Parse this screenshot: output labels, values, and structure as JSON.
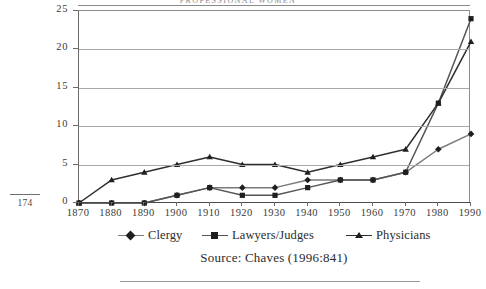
{
  "page": {
    "running_head": "PROFESSIONAL WOMEN",
    "folio": "174"
  },
  "source_caption": "Source: Chaves (1996:841)",
  "legend": {
    "entries": [
      {
        "label": "Clergy",
        "marker": "diamond-marker-icon",
        "color": "#7a7a7a"
      },
      {
        "label": "Lawyers/Judges",
        "marker": "square-marker-icon",
        "color": "#555555"
      },
      {
        "label": "Physicians",
        "marker": "triangle-marker-icon",
        "color": "#2f2f2f"
      }
    ]
  },
  "chart_data": {
    "type": "line",
    "title": "PROFESSIONAL WOMEN",
    "xlabel": "",
    "ylabel": "",
    "grid": true,
    "legend_position": "bottom",
    "xlim": [
      1870,
      1990
    ],
    "ylim": [
      0,
      25
    ],
    "ytick_labels": [
      "0",
      "5",
      "10",
      "15",
      "20",
      "25"
    ],
    "ytick_values": [
      0,
      5,
      10,
      15,
      20,
      25
    ],
    "categories": [
      "1870",
      "1880",
      "1890",
      "1900",
      "1910",
      "1920",
      "1930",
      "1940",
      "1950",
      "1960",
      "1970",
      "1980",
      "1990"
    ],
    "x": [
      1870,
      1880,
      1890,
      1900,
      1910,
      1920,
      1930,
      1940,
      1950,
      1960,
      1970,
      1980,
      1990
    ],
    "series": [
      {
        "name": "Clergy",
        "color": "#7a7a7a",
        "marker": "diamond",
        "values": [
          0,
          0,
          0,
          1,
          2,
          2,
          2,
          3,
          3,
          3,
          4,
          7,
          9
        ]
      },
      {
        "name": "Lawyers/Judges",
        "color": "#555555",
        "marker": "square",
        "values": [
          0,
          0,
          0,
          1,
          2,
          1,
          1,
          2,
          3,
          3,
          4,
          13,
          24
        ]
      },
      {
        "name": "Physicians",
        "color": "#2f2f2f",
        "marker": "triangle",
        "values": [
          0,
          3,
          4,
          5,
          6,
          5,
          5,
          4,
          5,
          6,
          7,
          13,
          21
        ]
      }
    ],
    "source": "Source: Chaves (1996:841)"
  }
}
